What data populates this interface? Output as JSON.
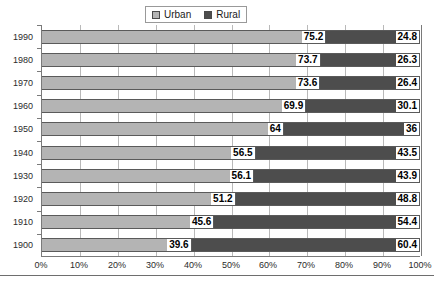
{
  "chart_data": {
    "type": "bar",
    "orientation": "horizontal",
    "stacked": true,
    "normalized_percent": true,
    "title": "",
    "subtitle": "",
    "xlabel": "",
    "ylabel": "",
    "xlim": [
      0,
      100
    ],
    "grid": true,
    "legend_position": "top-center",
    "categories": [
      "1990",
      "1980",
      "1970",
      "1960",
      "1950",
      "1940",
      "1930",
      "1920",
      "1910",
      "1900"
    ],
    "xticks": [
      0,
      10,
      20,
      30,
      40,
      50,
      60,
      70,
      80,
      90,
      100
    ],
    "xticklabels": [
      "0%",
      "10%",
      "20%",
      "30%",
      "40%",
      "50%",
      "60%",
      "70%",
      "80%",
      "90%",
      "100%"
    ],
    "series": [
      {
        "name": "Urban",
        "color": "#b4b4b4",
        "values": [
          75.2,
          73.7,
          73.6,
          69.9,
          64,
          56.5,
          56.1,
          51.2,
          45.6,
          39.6
        ],
        "labels": [
          "75.2",
          "73.7",
          "73.6",
          "69.9",
          "64",
          "56.5",
          "56.1",
          "51.2",
          "45.6",
          "39.6"
        ]
      },
      {
        "name": "Rural",
        "color": "#4d4d4d",
        "values": [
          24.8,
          26.3,
          26.4,
          30.1,
          36,
          43.5,
          43.9,
          48.8,
          54.4,
          60.4
        ],
        "labels": [
          "24.8",
          "26.3",
          "26.4",
          "30.1",
          "36",
          "43.5",
          "43.9",
          "48.8",
          "54.4",
          "60.4"
        ]
      }
    ]
  },
  "legend": {
    "entries": [
      {
        "label": "Urban",
        "swatch": "urban-swatch"
      },
      {
        "label": "Rural",
        "swatch": "rural-swatch"
      }
    ]
  },
  "colors": {
    "urban": "#b4b4b4",
    "rural": "#4d4d4d",
    "gridline": "#b9b9b9",
    "axis": "#7a7a7a",
    "label_text": "#2b2b2b",
    "value_text": "#000000",
    "background": "#ffffff"
  }
}
